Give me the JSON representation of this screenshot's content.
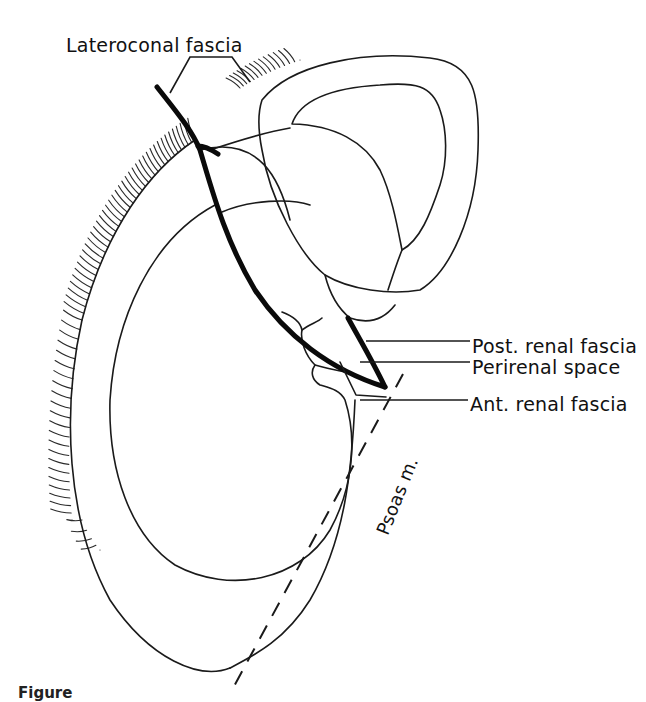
{
  "figure": {
    "type": "anatomical-line-drawing",
    "stroke_color": "#1a1a1a",
    "background": "#ffffff"
  },
  "labels": {
    "lateroconal": "Lateroconal fascia",
    "post_renal": "Post. renal fascia",
    "perirenal": "Perirenal space",
    "ant_renal": "Ant. renal fascia",
    "psoas": "Psoas m."
  },
  "caption": {
    "text": "Figure"
  }
}
